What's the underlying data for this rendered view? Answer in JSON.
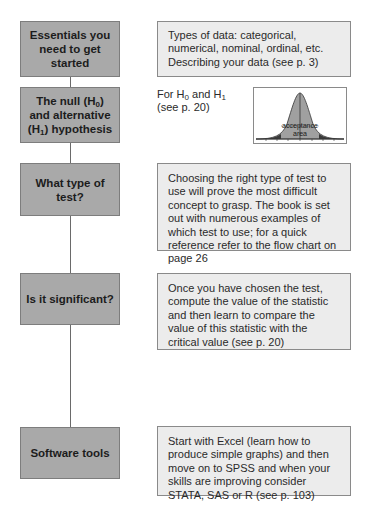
{
  "steps": [
    {
      "label": "Essentials you need to get started",
      "description": "Types of data: categorical, numerical, nominal, ordinal, etc. Describing your data (see p. 3)"
    },
    {
      "label_parts": [
        "The null (H",
        "0",
        ") and alternative (H",
        "1",
        ") hypothesis"
      ],
      "note_parts": [
        "For H",
        "0",
        " and H",
        "1"
      ],
      "note_ref": "(see p. 20)",
      "figure": {
        "type": "normal-distribution-curve",
        "area_label_line1": "acceptance",
        "area_label_line2": "area"
      }
    },
    {
      "label": "What type of test?",
      "description": "Choosing the right type of test to use will prove the most difficult concept to grasp. The book is set out with numerous examples of which test to use; for a quick reference refer to the flow chart on page 26"
    },
    {
      "label": "Is it significant?",
      "description": "Once you have chosen the test, compute the value of the statistic and then learn to compare the value of this statistic with the critical value (see p. 20)"
    },
    {
      "label": "Software tools",
      "description": "Start with Excel (learn how to produce simple graphs) and then move on to SPSS and when your skills are improving consider STATA, SAS or R (see p. 103)"
    }
  ],
  "colors": {
    "step_box_fill": "#a9a9a9",
    "description_box_fill": "#ececec",
    "connector_line": "#6a6a6a",
    "curve_fill": "#a0a0a0",
    "tail_fill": "#3a3a3a"
  }
}
